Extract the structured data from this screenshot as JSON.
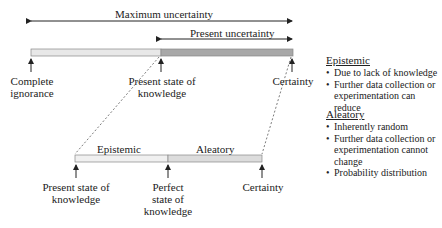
{
  "top": {
    "max_uncertainty": "Maximum uncertainty",
    "present_uncertainty": "Present uncertainty",
    "labels": {
      "complete_ignorance_1": "Complete",
      "complete_ignorance_2": "ignorance",
      "present_state_1": "Present state of",
      "present_state_2": "knowledge",
      "certainty": "Certainty"
    }
  },
  "bottom": {
    "epistemic": "Epistemic",
    "aleatory": "Aleatory",
    "labels": {
      "present_state_1": "Present state of",
      "present_state_2": "knowledge",
      "perfect_1": "Perfect",
      "perfect_2": "state of",
      "perfect_3": "knowledge",
      "certainty": "Certainty"
    }
  },
  "legend": {
    "epistemic": {
      "title": "Epistemic",
      "items": [
        "Due to lack of knowledge",
        "Further data collection or experimentation can reduce"
      ]
    },
    "aleatory": {
      "title": "Aleatory",
      "items": [
        "Inherently random",
        "Further data collection or experimentation cannot change",
        "Probability distribution"
      ]
    }
  },
  "colors": {
    "light_bar": "#e6e6e6",
    "dark_bar": "#a8a8a8",
    "line": "#222222"
  }
}
